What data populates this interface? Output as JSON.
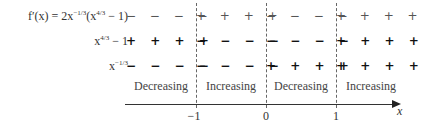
{
  "rows": [
    {
      "label": {
        "prefix": "f′(x) = 2x",
        "exp1": "−1/3",
        "mid": "(x",
        "exp2": "4/3",
        "suffix": " − 1)"
      },
      "signs": [
        "− − − −",
        "+ + + +",
        "− − − −",
        "+ + + +"
      ]
    },
    {
      "label": {
        "prefix": "x",
        "exp1": "4/3",
        "suffix": " − 1"
      },
      "signs": [
        "+ + + +",
        "− − − −",
        "− − − −",
        "+ + + +"
      ]
    },
    {
      "label": {
        "prefix": "x",
        "exp1": "−1/3"
      },
      "signs": [
        "− − − −",
        "− − − −",
        "+ + + +",
        "+ + + +"
      ]
    }
  ],
  "intervals": [
    "Decreasing",
    "Increasing",
    "Decreasing",
    "Increasing"
  ],
  "axis": {
    "ticks": [
      "−1",
      "0",
      "1"
    ],
    "label": "x"
  }
}
